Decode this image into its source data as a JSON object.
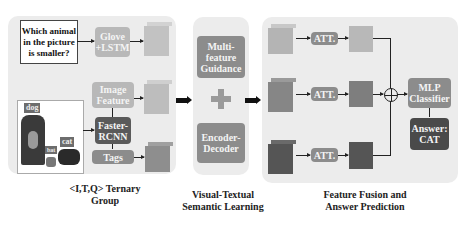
{
  "section1": {
    "question": "Which animal in the picture is smaller?",
    "glove_lstm": "Glove +LSTM",
    "image_feature": "Image Feature",
    "faster_rcnn": "Faster-RCNN",
    "tags": "Tags",
    "photo_labels": [
      "dog",
      "cat",
      "bat"
    ],
    "caption_line1": "<I,T,Q> Ternary",
    "caption_line2": "Group"
  },
  "section2": {
    "multi_feature": "Multi-feature Guidance",
    "plus": "+",
    "encoder_decoder": "Encoder-Decoder",
    "caption_line1": "Visual-Textual",
    "caption_line2": "Semantic Learning"
  },
  "section3": {
    "att_labels": [
      "ATT.",
      "ATT.",
      "ATT."
    ],
    "mlp": "MLP Classifier",
    "answer": "Answer: CAT",
    "caption_line1": "Feature Fusion and",
    "caption_line2": "Answer Prediction"
  },
  "colors": {
    "panel": "#ececec",
    "light": "#b8b8b8",
    "mid": "#8c8c8c",
    "dark": "#5a5a5a"
  }
}
